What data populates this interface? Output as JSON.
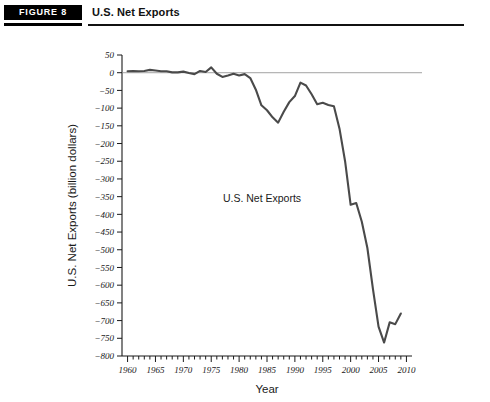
{
  "header": {
    "badge_label": "FIGURE 8",
    "title": "U.S. Net Exports"
  },
  "chart_data": {
    "type": "line",
    "title": "U.S. Net Exports",
    "xlabel": "Year",
    "ylabel": "U.S. Net Exports (billion dollars)",
    "annotation": "U.S. Net Exports",
    "xlim": [
      1959,
      2011
    ],
    "ylim": [
      -800,
      50
    ],
    "grid": false,
    "legend": "none",
    "zero_reference_line": true,
    "line_color": "#4a4a4a",
    "axis_color": "#1a1a1a",
    "zero_line_color": "#8c8c8c",
    "xticks": [
      1960,
      1965,
      1970,
      1975,
      1980,
      1985,
      1990,
      1995,
      2000,
      2005,
      2010
    ],
    "xtick_labels": [
      "1960",
      "1965",
      "1970",
      "1975",
      "1980",
      "1985",
      "1990",
      "1995",
      "2000",
      "2005",
      "2010"
    ],
    "xminor_step": 1,
    "yticks": [
      50,
      0,
      -50,
      -100,
      -150,
      -200,
      -250,
      -300,
      -350,
      -400,
      -450,
      -500,
      -550,
      -600,
      -650,
      -700,
      -750,
      -800
    ],
    "ytick_labels": [
      "50",
      "0",
      "-50",
      "-100",
      "-150",
      "-200",
      "-250",
      "-300",
      "-350",
      "-400",
      "-450",
      "-500",
      "-550",
      "-600",
      "-650",
      "-700",
      "-750",
      "-800"
    ],
    "series": [
      {
        "name": "U.S. Net Exports",
        "x": [
          1960,
          1961,
          1962,
          1963,
          1964,
          1965,
          1966,
          1967,
          1968,
          1969,
          1970,
          1971,
          1972,
          1973,
          1974,
          1975,
          1976,
          1977,
          1978,
          1979,
          1980,
          1981,
          1982,
          1983,
          1984,
          1985,
          1986,
          1987,
          1988,
          1989,
          1990,
          1991,
          1992,
          1993,
          1994,
          1995,
          1996,
          1997,
          1998,
          1999,
          2000,
          2001,
          2002,
          2003,
          2004,
          2005,
          2006,
          2007,
          2008,
          2009
        ],
        "values": [
          4,
          5,
          4,
          5,
          8,
          6,
          4,
          4,
          1,
          1,
          3,
          -1,
          -4,
          5,
          2,
          15,
          -3,
          -12,
          -8,
          -3,
          -8,
          -4,
          -15,
          -48,
          -92,
          -106,
          -126,
          -141,
          -110,
          -83,
          -66,
          -28,
          -36,
          -61,
          -89,
          -85,
          -91,
          -95,
          -158,
          -250,
          -373,
          -368,
          -421,
          -495,
          -611,
          -717,
          -762,
          -705,
          -710,
          -680
        ]
      }
    ]
  }
}
